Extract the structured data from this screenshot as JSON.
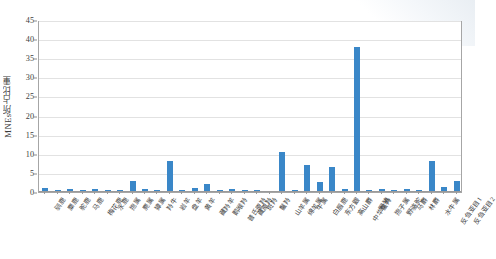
{
  "chart_data": {
    "type": "bar",
    "title": "",
    "xlabel": "",
    "ylabel": "MNEs所占比重",
    "ylim": [
      0,
      45
    ],
    "ytick_step": 5,
    "yticks": [
      0,
      5,
      10,
      15,
      20,
      25,
      30,
      35,
      40,
      45
    ],
    "grid": true,
    "legend": false,
    "series_color": "#3a87c8",
    "categories": [
      "驯鹿",
      "麋鹿",
      "驼鹿",
      "马鹿",
      "梅花鹿",
      "水鹿",
      "狍属",
      "麂属",
      "獐属",
      "羚牛",
      "岩羊",
      "盘羊",
      "黄羊",
      "藏羚羊",
      "鹅喉羚",
      "普氏原羚",
      "藏原羚",
      "斑羚",
      "鬣羚",
      "山羊属",
      "绵羊属",
      "牛属",
      "白唇鹿",
      "东方鼹",
      "高山麝",
      "中华鬣羚",
      "野猪",
      "狍子属",
      "野骆驼",
      "马麝",
      "林麝",
      "水牛属",
      "反刍亚目1",
      "反刍亚目2"
    ],
    "values": [
      1.0,
      0.6,
      0.8,
      0.5,
      0.7,
      0.4,
      0.5,
      3.0,
      0.8,
      0.6,
      8.0,
      0.5,
      1.0,
      2.2,
      0.4,
      0.7,
      0.5,
      0.4,
      0.3,
      10.5,
      0.5,
      7.0,
      2.6,
      6.5,
      0.8,
      38.0,
      0.5,
      0.7,
      0.6,
      0.9,
      0.5,
      8.0,
      1.2,
      2.9
    ],
    "values_note": "Percent of MNEs per taxon"
  },
  "axis": {
    "y_title": "MNEs所占比重",
    "y_tick_labels": [
      "45",
      "40",
      "35",
      "30",
      "25",
      "20",
      "15",
      "10",
      "5",
      "0"
    ]
  }
}
